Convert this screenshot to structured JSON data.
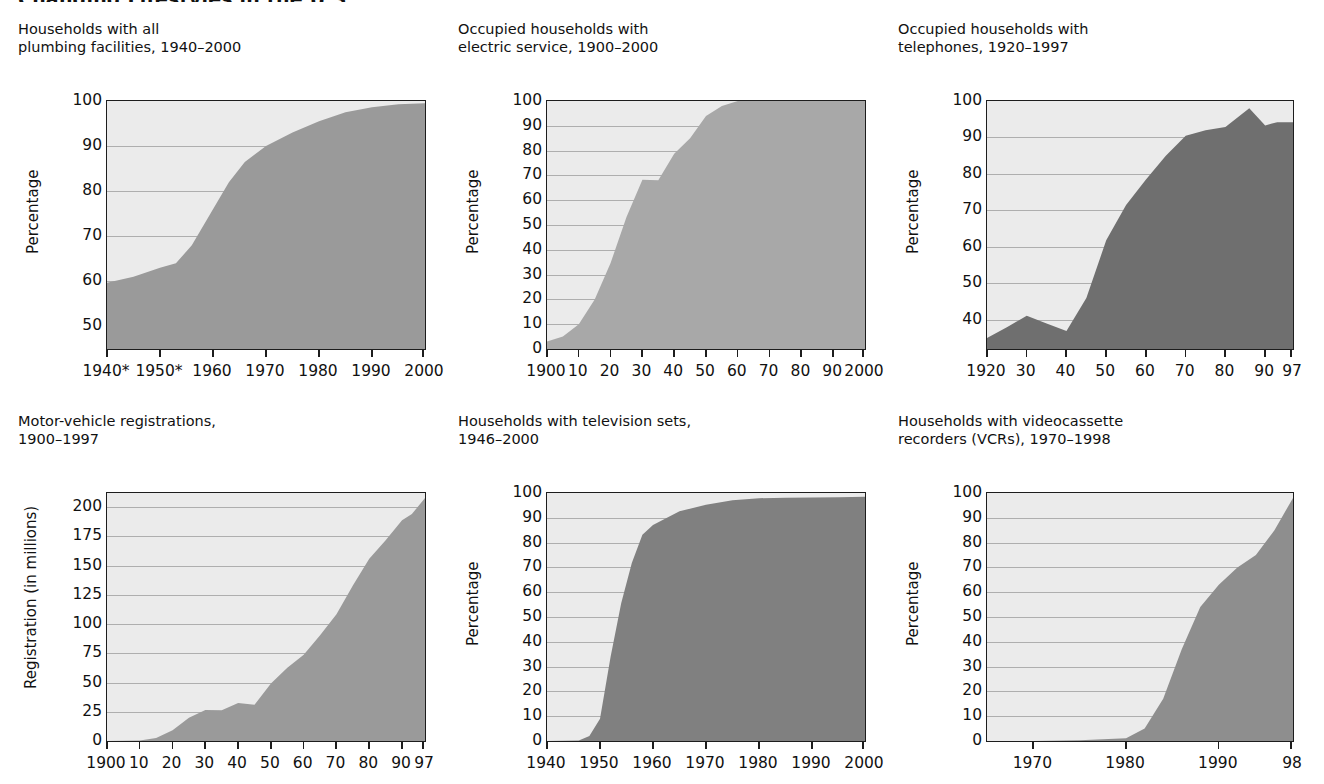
{
  "page": {
    "title": "Changing Lifestyles in the U.S."
  },
  "chart_data": [
    {
      "id": "plumbing",
      "type": "area",
      "title": "Households with all\nplumbing facilities, 1940–2000",
      "xlabel": "",
      "ylabel": "Percentage",
      "ylim": [
        45,
        100
      ],
      "yticks": [
        50,
        60,
        70,
        80,
        90,
        100
      ],
      "xlim": [
        1940,
        2000
      ],
      "xtick_values": [
        1940,
        1950,
        1960,
        1970,
        1980,
        1990,
        2000
      ],
      "xtick_labels": [
        "1940*",
        "1950*",
        "1960",
        "1970",
        "1980",
        "1990",
        "2000"
      ],
      "grid": true,
      "fill_color": "#9a9a9a",
      "x": [
        1940,
        1945,
        1950,
        1953,
        1956,
        1960,
        1963,
        1966,
        1970,
        1975,
        1980,
        1985,
        1990,
        1995,
        2000
      ],
      "values": [
        59.7,
        61.0,
        63.0,
        64.0,
        68.0,
        76.0,
        82.0,
        86.5,
        90.0,
        93.0,
        95.5,
        97.5,
        98.6,
        99.3,
        99.5
      ]
    },
    {
      "id": "electric",
      "type": "area",
      "title": "Occupied households with\nelectric service, 1900–2000",
      "xlabel": "",
      "ylabel": "Percentage",
      "ylim": [
        0,
        100
      ],
      "yticks": [
        0,
        10,
        20,
        30,
        40,
        50,
        60,
        70,
        80,
        90,
        100
      ],
      "xlim": [
        1900,
        2000
      ],
      "xtick_values": [
        1900,
        1910,
        1920,
        1930,
        1940,
        1950,
        1960,
        1970,
        1980,
        1990,
        2000
      ],
      "xtick_labels": [
        "1900",
        "10",
        "20",
        "30",
        "40",
        "50",
        "60",
        "70",
        "80",
        "90",
        "2000"
      ],
      "grid": true,
      "fill_color": "#a8a8a8",
      "x": [
        1900,
        1905,
        1910,
        1915,
        1920,
        1925,
        1930,
        1935,
        1940,
        1945,
        1950,
        1955,
        1960,
        1970,
        1980,
        1990,
        2000
      ],
      "values": [
        3.0,
        5.0,
        10.0,
        20.0,
        34.7,
        53.2,
        68.2,
        68.0,
        78.7,
        85.0,
        94.0,
        98.0,
        100.0,
        100.0,
        100.0,
        100.0,
        100.0
      ]
    },
    {
      "id": "telephones",
      "type": "area",
      "title": "Occupied households with\ntelephones, 1920–1997",
      "xlabel": "",
      "ylabel": "Percentage",
      "ylim": [
        32,
        100
      ],
      "yticks": [
        40,
        50,
        60,
        70,
        80,
        90,
        100
      ],
      "xlim": [
        1920,
        1997
      ],
      "xtick_values": [
        1920,
        1930,
        1940,
        1950,
        1960,
        1970,
        1980,
        1990,
        1997
      ],
      "xtick_labels": [
        "1920",
        "30",
        "40",
        "50",
        "60",
        "70",
        "80",
        "90",
        "97"
      ],
      "grid": true,
      "fill_color": "#6f6f6f",
      "x": [
        1920,
        1925,
        1930,
        1935,
        1940,
        1945,
        1950,
        1955,
        1960,
        1965,
        1970,
        1975,
        1980,
        1986,
        1990,
        1993,
        1997
      ],
      "values": [
        35.0,
        38.0,
        41.1,
        39.0,
        36.9,
        46.0,
        61.8,
        71.5,
        78.5,
        85.0,
        90.5,
        92.0,
        92.9,
        98.0,
        93.3,
        94.2,
        94.2
      ]
    },
    {
      "id": "motor-vehicles",
      "type": "area",
      "title": "Motor-vehicle registrations,\n1900–1997",
      "xlabel": "",
      "ylabel": "Registration (in millions)",
      "ylim": [
        0,
        212
      ],
      "yticks": [
        0,
        25,
        50,
        75,
        100,
        125,
        150,
        175,
        200
      ],
      "xlim": [
        1900,
        1997
      ],
      "xtick_values": [
        1900,
        1910,
        1920,
        1930,
        1940,
        1950,
        1960,
        1970,
        1980,
        1990,
        1997
      ],
      "xtick_labels": [
        "1900",
        "10",
        "20",
        "30",
        "40",
        "50",
        "60",
        "70",
        "80",
        "90",
        "97"
      ],
      "grid": true,
      "fill_color": "#9a9a9a",
      "x": [
        1900,
        1910,
        1915,
        1920,
        1925,
        1930,
        1935,
        1940,
        1945,
        1950,
        1955,
        1960,
        1965,
        1970,
        1975,
        1980,
        1985,
        1990,
        1993,
        1997
      ],
      "values": [
        0.008,
        0.5,
        2.5,
        9.2,
        19.9,
        26.5,
        26.2,
        32.4,
        31.0,
        49.2,
        62.7,
        73.8,
        90.4,
        108.4,
        132.9,
        155.8,
        171.7,
        188.8,
        194.0,
        207.8
      ]
    },
    {
      "id": "television",
      "type": "area",
      "title": "Households with television sets,\n1946–2000",
      "xlabel": "",
      "ylabel": "Percentage",
      "ylim": [
        0,
        100
      ],
      "yticks": [
        0,
        10,
        20,
        30,
        40,
        50,
        60,
        70,
        80,
        90,
        100
      ],
      "xlim": [
        1940,
        2000
      ],
      "xtick_values": [
        1940,
        1950,
        1960,
        1970,
        1980,
        1990,
        2000
      ],
      "xtick_labels": [
        "1940",
        "1950",
        "1960",
        "1970",
        "1980",
        "1990",
        "2000"
      ],
      "grid": true,
      "fill_color": "#808080",
      "x": [
        1940,
        1946,
        1948,
        1950,
        1952,
        1954,
        1956,
        1958,
        1960,
        1965,
        1970,
        1975,
        1980,
        1985,
        1990,
        1995,
        2000
      ],
      "values": [
        0.0,
        0.2,
        2.0,
        9.0,
        34.0,
        55.5,
        71.8,
        83.2,
        87.1,
        92.6,
        95.3,
        97.1,
        97.9,
        98.1,
        98.2,
        98.3,
        98.5
      ]
    },
    {
      "id": "vcr",
      "type": "area",
      "title": "Households with videocassette\nrecorders (VCRs), 1970–1998",
      "xlabel": "",
      "ylabel": "Percentage",
      "ylim": [
        0,
        100
      ],
      "yticks": [
        0,
        10,
        20,
        30,
        40,
        50,
        60,
        70,
        80,
        90,
        100
      ],
      "xlim": [
        1965,
        1998
      ],
      "xtick_values": [
        1970,
        1980,
        1990,
        1998
      ],
      "xtick_labels": [
        "1970",
        "1980",
        "1990",
        "98"
      ],
      "grid": true,
      "fill_color": "#8e8e8e",
      "x": [
        1965,
        1970,
        1975,
        1980,
        1982,
        1984,
        1986,
        1988,
        1990,
        1992,
        1994,
        1996,
        1998
      ],
      "values": [
        0.0,
        0.0,
        0.3,
        1.1,
        5.0,
        17.0,
        37.0,
        54.0,
        63.0,
        70.0,
        75.0,
        85.0,
        98.0
      ]
    }
  ]
}
